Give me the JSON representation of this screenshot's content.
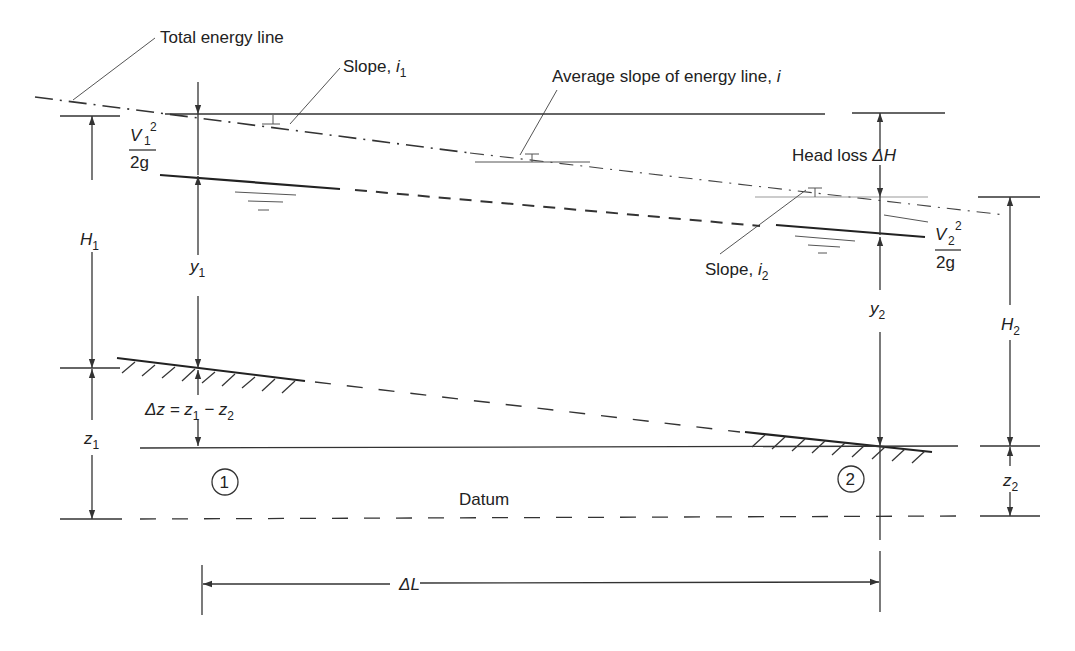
{
  "diagram": {
    "labels": {
      "total_energy_line": "Total energy line",
      "slope_i1_prefix": "Slope, ",
      "slope_i1_var": "i",
      "slope_i1_sub": "1",
      "avg_slope_prefix": "Average slope of energy line, ",
      "avg_slope_var": "i",
      "head_loss_prefix": "Head loss ",
      "head_loss_var": "ΔH",
      "slope_i2_prefix": "Slope, ",
      "slope_i2_var": "i",
      "slope_i2_sub": "2",
      "v1_num_var": "V",
      "v1_num_sub": "1",
      "v1_num_sup": "2",
      "v1_den": "2g",
      "v2_num_var": "V",
      "v2_num_sub": "2",
      "v2_num_sup": "2",
      "v2_den": "2g",
      "H1_var": "H",
      "H1_sub": "1",
      "H2_var": "H",
      "H2_sub": "2",
      "y1_var": "y",
      "y1_sub": "1",
      "y2_var": "y",
      "y2_sub": "2",
      "z1_var": "z",
      "z1_sub": "1",
      "z2_var": "z",
      "z2_sub": "2",
      "delta_z_text": "Δz = z",
      "delta_z_sub1": "1",
      "delta_z_minus": " − z",
      "delta_z_sub2": "2",
      "section1": "1",
      "section2": "2",
      "datum": "Datum",
      "delta_L": "ΔL"
    }
  }
}
